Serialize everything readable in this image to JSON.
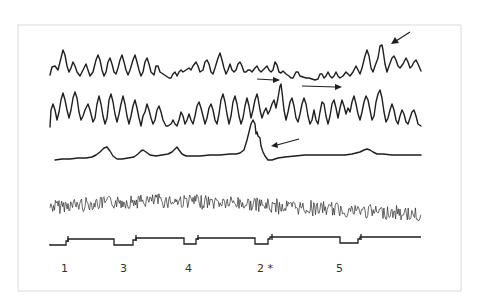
{
  "figure": {
    "traces": [
      {
        "id": "trace-1",
        "name": "oscillatory trace (top)"
      },
      {
        "id": "trace-2",
        "name": "oscillatory trace (second)"
      },
      {
        "id": "trace-3",
        "name": "slow response trace with large spike"
      },
      {
        "id": "trace-4",
        "name": "high-frequency noisy band"
      },
      {
        "id": "trace-5",
        "name": "event marker / stimulus channel"
      }
    ],
    "event_labels": [
      {
        "text": "1",
        "x": 64
      },
      {
        "text": "3",
        "x": 123
      },
      {
        "text": "4",
        "x": 188
      },
      {
        "text": "2 *",
        "x": 264
      },
      {
        "text": "5",
        "x": 339
      }
    ],
    "arrows": [
      {
        "name": "arrow-top-right",
        "direction": "down-left"
      },
      {
        "name": "arrow-right-1",
        "direction": "right"
      },
      {
        "name": "arrow-right-2",
        "direction": "right"
      },
      {
        "name": "arrow-spike",
        "direction": "left"
      }
    ],
    "colors": {
      "ink": "#1e1e1e",
      "frame": "#d9d9d9",
      "background": "#ffffff"
    }
  }
}
